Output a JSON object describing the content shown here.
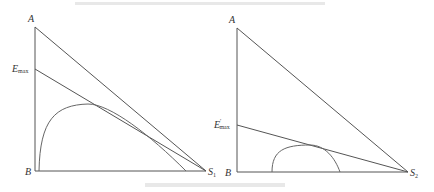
{
  "diagram": {
    "type": "enzyme-substrate triangle diagrams (two panels)",
    "caption_top": "",
    "caption_bottom": "",
    "left_panel": {
      "vertices": {
        "A": "A",
        "B": "B",
        "S": "S",
        "S_sub": "1"
      },
      "emax_label": "E",
      "emax_sub": "max",
      "points": {
        "A": [
          35,
          27
        ],
        "B": [
          35,
          171
        ],
        "S": [
          206,
          171
        ],
        "E": [
          35,
          69
        ]
      },
      "curve": "M39,171 C40,120 55,105 88,104 C110,104 150,135 186,171"
    },
    "right_panel": {
      "vertices": {
        "A": "A",
        "B": "B",
        "S": "S",
        "S_sub": "2"
      },
      "emax_label": "E",
      "emax_prime": "′",
      "emax_sub": "max",
      "points": {
        "A": [
          237,
          28
        ],
        "B": [
          237,
          172
        ],
        "S": [
          408,
          172
        ],
        "E": [
          237,
          125
        ]
      },
      "curve": "M272,172 C272,150 285,145 310,145 C325,145 335,158 340,172"
    }
  }
}
